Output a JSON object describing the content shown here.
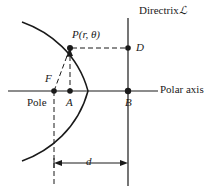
{
  "figure": {
    "type": "conic-section-polar-diagram",
    "width": 222,
    "height": 193,
    "background_color": "#ffffff",
    "stroke_color": "#1a1a1a"
  },
  "labels": {
    "directrix": "Directrix",
    "directrix_symbol": "ℒ",
    "point_P": "P(r, θ)",
    "point_D": "D",
    "point_F": "F",
    "pole": "Pole",
    "point_A": "A",
    "point_B": "B",
    "polar_axis": "Polar axis",
    "distance_d": "d"
  },
  "geometry": {
    "polar_axis_y": 91,
    "directrix_x": 128,
    "focus_F": {
      "x": 54,
      "y": 91
    },
    "point_A": {
      "x": 70,
      "y": 91
    },
    "point_B": {
      "x": 128,
      "y": 91
    },
    "point_D": {
      "x": 128,
      "y": 48
    },
    "point_P": {
      "x": 70,
      "y": 48
    },
    "vertex": {
      "x": 88,
      "y": 91
    },
    "dimension_line_y": 163,
    "dimension_from_x": 54,
    "dimension_to_x": 128,
    "curve_top_end": {
      "x": 22,
      "y": 22
    },
    "curve_bottom_end": {
      "x": 22,
      "y": 161
    }
  }
}
